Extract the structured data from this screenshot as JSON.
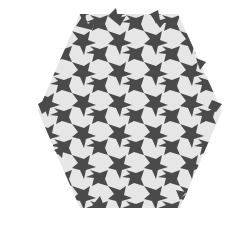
{
  "image": {
    "description": "Hexagonal tessellation of interlocking bird-like tiles",
    "colors": {
      "background": "#ffffff",
      "dark_tile": "#4a4a4a",
      "light_tile": "#e6e6e6"
    },
    "shape": "hexagon",
    "bounds": {
      "left": 38,
      "top": 14,
      "right": 222,
      "bottom": 208
    }
  }
}
